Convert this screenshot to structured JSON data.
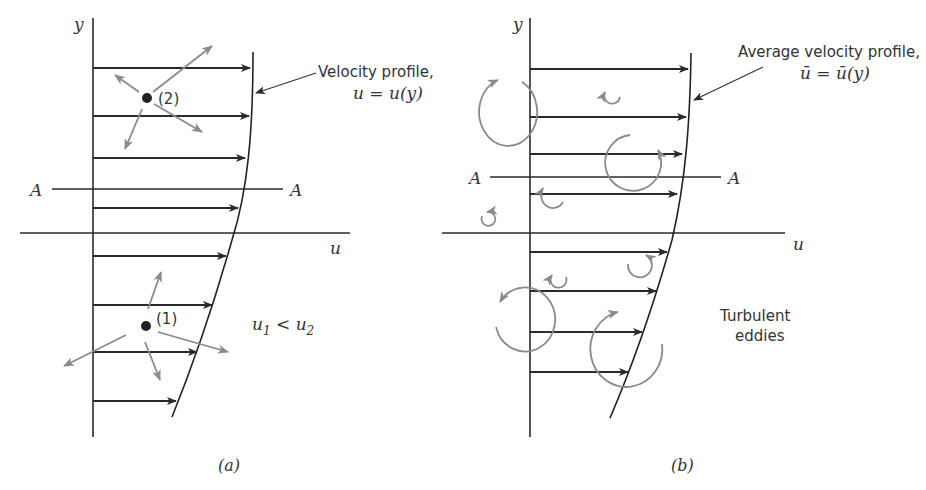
{
  "figure": {
    "panel_a": {
      "caption": "(a)",
      "y_axis_label": "y",
      "u_axis_label": "u",
      "plane_label_left": "A",
      "plane_label_right": "A",
      "profile_label_line1": "Velocity profile,",
      "profile_label_line2": "u = u(y)",
      "point_2_label": "(2)",
      "point_1_label": "(1)",
      "inequality": {
        "u1": "u",
        "sub1": "1",
        "lt": " < ",
        "u2": "u",
        "sub2": "2"
      },
      "velocity_arrow_count": 8
    },
    "panel_b": {
      "caption": "(b)",
      "y_axis_label": "y",
      "u_axis_label": "u",
      "plane_label_left": "A",
      "plane_label_right": "A",
      "profile_label_line1": "Average velocity profile,",
      "profile_label_line2": "ū = ū(y)",
      "eddies_label_line1": "Turbulent",
      "eddies_label_line2": "eddies",
      "velocity_arrow_count": 8
    },
    "colors": {
      "ink": "#2a2a2a",
      "gray_arrows": "#8a8a8a",
      "background": "#ffffff"
    }
  }
}
